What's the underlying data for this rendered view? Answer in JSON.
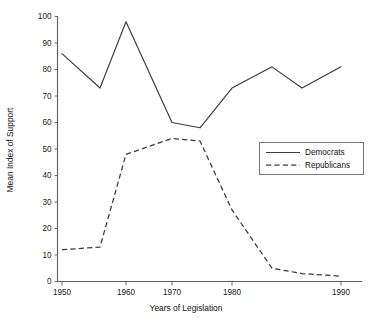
{
  "chart_data": {
    "type": "line",
    "title": "",
    "xlabel": "Years of Legislation",
    "ylabel": "Mean Index of Support",
    "x": [
      1950,
      1955,
      1960,
      1965,
      1970,
      1975,
      1980,
      1985,
      1990
    ],
    "x_tick_labels": [
      "1950",
      "1960",
      "1970",
      "1980",
      "1990"
    ],
    "x_tick_values": [
      1950,
      1960,
      1970,
      1980,
      1990
    ],
    "y_tick_labels": [
      "0",
      "10",
      "20",
      "30",
      "40",
      "50",
      "60",
      "70",
      "80",
      "90",
      "100"
    ],
    "y_tick_values": [
      0,
      10,
      20,
      30,
      40,
      50,
      60,
      70,
      80,
      90,
      100
    ],
    "ylim": [
      0,
      100
    ],
    "grid": false,
    "legend_position": "center-right",
    "series": [
      {
        "name": "Democrats",
        "style": "solid",
        "color": "#3a3a3a",
        "values": [
          86,
          73,
          98,
          74,
          60,
          58,
          73,
          81,
          81
        ]
      },
      {
        "name": "Republicans",
        "style": "dashed",
        "color": "#3a3a3a",
        "values": [
          12,
          13,
          48,
          52,
          54,
          53,
          27,
          5,
          2
        ]
      }
    ],
    "democrats_points": [
      {
        "x": 1950,
        "y": 86
      },
      {
        "x": 1955,
        "y": 73
      },
      {
        "x": 1960,
        "y": 98
      },
      {
        "x": 1970,
        "y": 60
      },
      {
        "x": 1975,
        "y": 58
      },
      {
        "x": 1980,
        "y": 73
      },
      {
        "x": 1983,
        "y": 81
      },
      {
        "x": 1986,
        "y": 73
      },
      {
        "x": 1990,
        "y": 81
      }
    ],
    "republicans_points": [
      {
        "x": 1950,
        "y": 12
      },
      {
        "x": 1955,
        "y": 13
      },
      {
        "x": 1960,
        "y": 48
      },
      {
        "x": 1970,
        "y": 54
      },
      {
        "x": 1975,
        "y": 53
      },
      {
        "x": 1980,
        "y": 27
      },
      {
        "x": 1983,
        "y": 5
      },
      {
        "x": 1986,
        "y": 3
      },
      {
        "x": 1990,
        "y": 2
      }
    ]
  },
  "legend": {
    "entries": [
      {
        "label": "Democrats",
        "style": "solid"
      },
      {
        "label": "Republicans",
        "style": "dashed"
      }
    ]
  }
}
